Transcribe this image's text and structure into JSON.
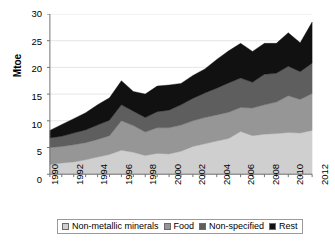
{
  "chart_data": {
    "type": "area",
    "stacked": true,
    "title": "",
    "xlabel": "",
    "ylabel": "Mtoe",
    "ylim": [
      0,
      30
    ],
    "yticks": [
      0,
      5,
      10,
      15,
      20,
      25,
      30
    ],
    "xlim": [
      1990,
      2012
    ],
    "grid": true,
    "legend_position": "bottom",
    "x": [
      1990,
      1991,
      1992,
      1993,
      1994,
      1995,
      1996,
      1997,
      1998,
      1999,
      2000,
      2001,
      2002,
      2003,
      2004,
      2005,
      2006,
      2007,
      2008,
      2009,
      2010,
      2011,
      2012
    ],
    "xtick_labels": [
      "1990",
      "1992",
      "1994",
      "1996",
      "1998",
      "2000",
      "2002",
      "2004",
      "2006",
      "2008",
      "2010",
      "2012"
    ],
    "series": [
      {
        "name": "Non-metallic minerals",
        "color": "#cfcfcf",
        "values": [
          1.8,
          2.1,
          2.3,
          2.7,
          3.2,
          3.7,
          4.5,
          4.1,
          3.5,
          3.9,
          3.8,
          4.3,
          5.2,
          5.7,
          6.2,
          6.7,
          8.0,
          7.2,
          7.5,
          7.6,
          7.8,
          7.7,
          8.2
        ]
      },
      {
        "name": "Food",
        "color": "#969696",
        "values": [
          3.2,
          3.1,
          3.2,
          3.2,
          3.3,
          3.5,
          5.5,
          5.0,
          4.4,
          4.8,
          4.9,
          4.9,
          4.8,
          4.9,
          4.9,
          4.9,
          4.5,
          5.2,
          5.5,
          5.9,
          6.9,
          6.3,
          6.9
        ]
      },
      {
        "name": "Non-specified",
        "color": "#5e5e5e",
        "values": [
          1.8,
          1.9,
          2.2,
          2.4,
          2.7,
          2.9,
          3.0,
          2.7,
          2.7,
          3.0,
          3.3,
          3.8,
          4.2,
          4.6,
          5.0,
          5.5,
          5.5,
          4.8,
          5.7,
          5.4,
          5.5,
          5.2,
          5.7
        ]
      },
      {
        "name": "Rest",
        "color": "#111111",
        "values": [
          1.4,
          2.2,
          2.7,
          3.2,
          3.8,
          4.2,
          4.5,
          3.7,
          4.4,
          4.8,
          4.7,
          4.0,
          4.3,
          4.5,
          5.4,
          6.0,
          6.5,
          5.8,
          5.8,
          5.6,
          6.3,
          5.4,
          7.7
        ]
      }
    ],
    "totals": [
      8.2,
      9.3,
      10.4,
      11.5,
      13.0,
      14.3,
      17.5,
      15.5,
      15.0,
      16.5,
      16.7,
      17.0,
      18.5,
      19.7,
      21.5,
      23.1,
      24.5,
      23.0,
      24.5,
      24.5,
      26.5,
      24.6,
      28.5
    ]
  },
  "legend": {
    "items": [
      {
        "label": "Non-metallic minerals",
        "color": "#cfcfcf"
      },
      {
        "label": "Food",
        "color": "#969696"
      },
      {
        "label": "Non-specified",
        "color": "#5e5e5e"
      },
      {
        "label": "Rest",
        "color": "#111111"
      }
    ]
  }
}
